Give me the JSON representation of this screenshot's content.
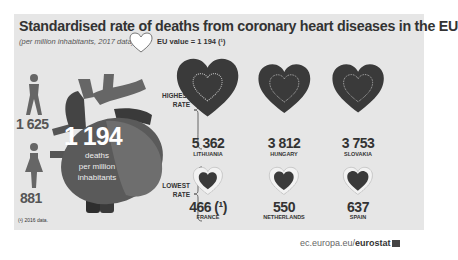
{
  "title": "Standardised rate of deaths from coronary heart diseases in the EU",
  "subtitle": "(per million inhabitants, 2017 data)",
  "eu_value_label": "EU value = 1 194 (¹)",
  "men_value": "1 625",
  "women_value": "881",
  "center": {
    "value": "1 194",
    "label_line1": "deaths",
    "label_line2": "per million",
    "label_line3": "inhabitants"
  },
  "highest_label": [
    "HIGHEST",
    "RATE"
  ],
  "lowest_label": [
    "LOWEST",
    "RATE"
  ],
  "footnote": "(¹) 2016 data.",
  "source_prefix": "ec.europa.eu/",
  "source_brand": "eurostat",
  "colors": {
    "heart_dark": "#3a3a3a",
    "panel_bg": "#e6e6e6",
    "text": "#333333"
  },
  "chart_data": {
    "type": "pictogram",
    "title": "Standardised rate of deaths from coronary heart diseases in the EU",
    "subtitle": "(per million inhabitants, 2017 data)",
    "eu_value": 1194,
    "by_sex": [
      {
        "name": "Men",
        "value": 1625
      },
      {
        "name": "Women",
        "value": 881
      }
    ],
    "highest": [
      {
        "country": "LITHUANIA",
        "value": 5362,
        "display": "5 362"
      },
      {
        "country": "HUNGARY",
        "value": 3812,
        "display": "3 812"
      },
      {
        "country": "SLOVAKIA",
        "value": 3753,
        "display": "3 753"
      }
    ],
    "lowest": [
      {
        "country": "FRANCE",
        "value": 466,
        "display": "466 (¹)"
      },
      {
        "country": "NETHERLANDS",
        "value": 550,
        "display": "550"
      },
      {
        "country": "SPAIN",
        "value": 637,
        "display": "637"
      }
    ]
  }
}
